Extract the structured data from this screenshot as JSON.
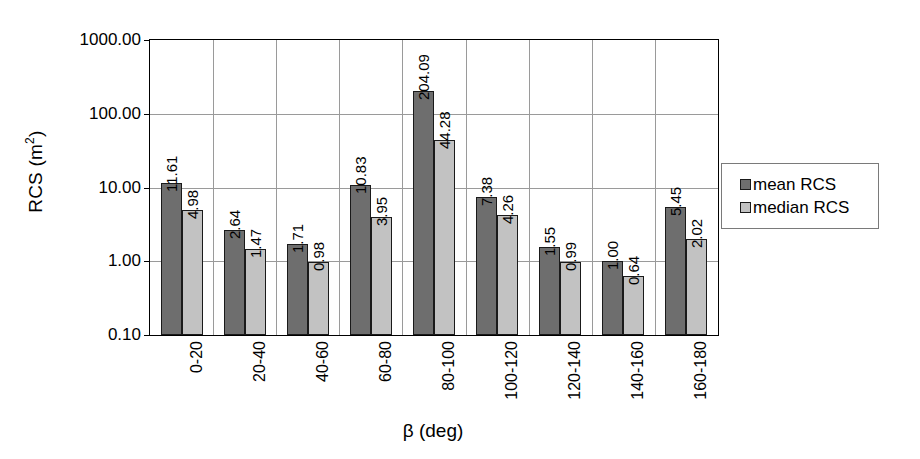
{
  "chart_data": {
    "type": "bar",
    "title": "",
    "subtitle": "",
    "xlabel": "β (deg)",
    "ylabel": "RCS (m²)",
    "ylabel_base": "RCS (m",
    "ylabel_sup": "2",
    "ylabel_close": ")",
    "yscale": "log",
    "ylim": [
      0.1,
      1000
    ],
    "ytick_labels": [
      "1000.00",
      "100.00",
      "10.00",
      "1.00",
      "0.10"
    ],
    "ytick_values": [
      1000,
      100,
      10,
      1,
      0.1
    ],
    "grid": "horizontal and vertical category separators",
    "legend_position": "right, outside plot area",
    "categories": [
      "0-20",
      "20-40",
      "40-60",
      "60-80",
      "80-100",
      "100-120",
      "120-140",
      "140-160",
      "160-180"
    ],
    "series": [
      {
        "name": "mean RCS",
        "color": "#6e6e6e",
        "values": [
          11.61,
          2.64,
          1.71,
          10.83,
          204.09,
          7.38,
          1.55,
          1.0,
          5.45
        ],
        "value_labels": [
          "11.61",
          "2.64",
          "1.71",
          "10.83",
          "204.09",
          "7.38",
          "1.55",
          "1.00",
          "5.45"
        ]
      },
      {
        "name": "median RCS",
        "color": "#c2c2c2",
        "values": [
          4.98,
          1.47,
          0.98,
          3.95,
          44.28,
          4.26,
          0.99,
          0.64,
          2.02
        ],
        "value_labels": [
          "4.98",
          "1.47",
          "0.98",
          "3.95",
          "44.28",
          "4.26",
          "0.99",
          "0.64",
          "2.02"
        ]
      }
    ]
  },
  "legend": {
    "items": [
      {
        "label": "mean RCS",
        "swatch": "mean"
      },
      {
        "label": "median RCS",
        "swatch": "median"
      }
    ]
  },
  "colors": {
    "mean_rcs": "#6e6e6e",
    "median_rcs": "#c2c2c2",
    "gridline": "#9a9a9a",
    "axis": "#000000",
    "background": "#ffffff"
  }
}
